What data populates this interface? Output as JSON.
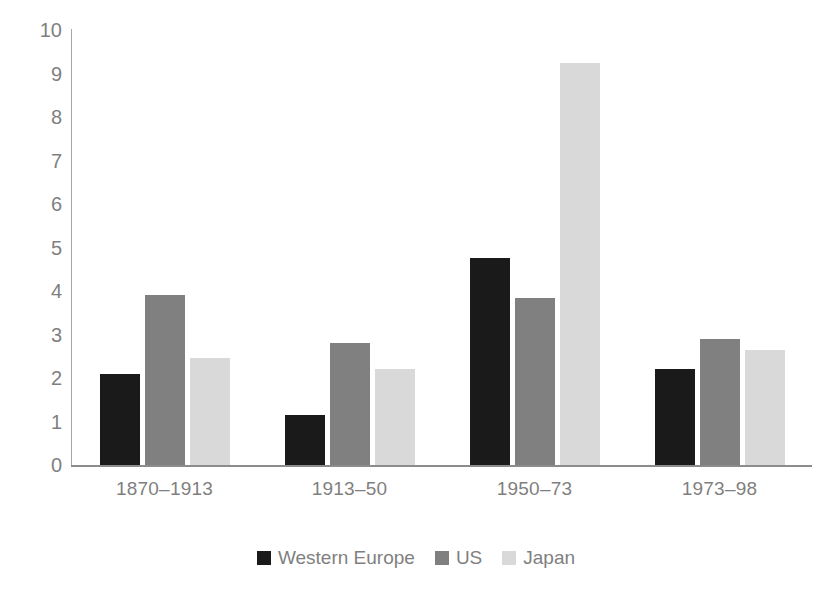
{
  "chart_data": {
    "type": "bar",
    "title": "",
    "subtitle": "",
    "xlabel": "",
    "ylabel": "",
    "ylim": [
      0,
      10
    ],
    "yticks": [
      10,
      9,
      8,
      7,
      6,
      5,
      4,
      3,
      2,
      1,
      0
    ],
    "grid": false,
    "legend_position": "bottom",
    "categories": [
      "1870–1913",
      "1913–50",
      "1950–73",
      "1973–98"
    ],
    "series": [
      {
        "name": "Western Europe",
        "color": "#1a1a1a",
        "values": [
          2.1,
          1.15,
          4.75,
          2.2
        ]
      },
      {
        "name": "US",
        "color": "#808080",
        "values": [
          3.9,
          2.8,
          3.85,
          2.9
        ]
      },
      {
        "name": "Japan",
        "color": "#d9d9d9",
        "values": [
          2.45,
          2.2,
          9.25,
          2.65
        ]
      }
    ]
  },
  "axis": {
    "tick_labels": [
      "10",
      "9",
      "8",
      "7",
      "6",
      "5",
      "4",
      "3",
      "2",
      "1",
      "0"
    ],
    "tick_color": "#7f7f7f",
    "axis_line_color": "#a6a6a6",
    "baseline_color": "#8c8c8c"
  },
  "categories": {
    "labels": [
      "1870–1913",
      "1913–50",
      "1950–73",
      "1973–98"
    ]
  },
  "legend": {
    "items": [
      {
        "label": "Western Europe",
        "color": "#1a1a1a"
      },
      {
        "label": "US",
        "color": "#808080"
      },
      {
        "label": "Japan",
        "color": "#d9d9d9"
      }
    ]
  }
}
